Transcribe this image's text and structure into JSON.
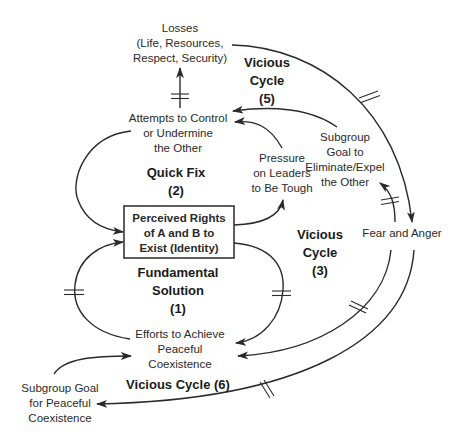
{
  "diagram": {
    "type": "causal-loop",
    "nodes": {
      "losses": {
        "lines": [
          "Losses",
          "(Life, Resources,",
          "Respect, Security)"
        ]
      },
      "attempts": {
        "lines": [
          "Attempts to Control",
          "or Undermine",
          "the Other"
        ]
      },
      "subgroup_eliminate": {
        "lines": [
          "Subgroup",
          "Goal to",
          "Eliminate/Expel",
          "the Other"
        ]
      },
      "pressure": {
        "lines": [
          "Pressure",
          "on Leaders",
          "to Be Tough"
        ]
      },
      "perceived_rights": {
        "lines": [
          "Perceived Rights",
          "of A and B to",
          "Exist (Identity)"
        ]
      },
      "fear_anger": {
        "lines": [
          "Fear and Anger"
        ]
      },
      "efforts": {
        "lines": [
          "Efforts to Achieve",
          "Peaceful",
          "Coexistence"
        ]
      },
      "subgroup_peaceful": {
        "lines": [
          "Subgroup Goal",
          "for Peaceful",
          "Coexistence"
        ]
      }
    },
    "loops": {
      "vicious5": {
        "lines": [
          "Vicious",
          "Cycle",
          "(5)"
        ]
      },
      "quickfix2": {
        "lines": [
          "Quick Fix",
          "(2)"
        ]
      },
      "vicious3": {
        "lines": [
          "Vicious",
          "Cycle",
          "(3)"
        ]
      },
      "fundamental1": {
        "lines": [
          "Fundamental",
          "Solution",
          "(1)"
        ]
      },
      "vicious6": {
        "lines": [
          "Vicious Cycle (6)"
        ]
      }
    },
    "edges": [
      {
        "from": "attempts",
        "to": "losses",
        "delay": true
      },
      {
        "from": "losses",
        "to": "fear_anger",
        "delay": true
      },
      {
        "from": "subgroup_eliminate",
        "to": "attempts",
        "delay": false
      },
      {
        "from": "pressure",
        "to": "attempts",
        "delay": false
      },
      {
        "from": "attempts",
        "to": "perceived_rights",
        "delay": false
      },
      {
        "from": "perceived_rights",
        "to": "pressure",
        "delay": false
      },
      {
        "from": "fear_anger",
        "to": "subgroup_eliminate",
        "delay": true
      },
      {
        "from": "efforts",
        "to": "perceived_rights",
        "delay": true
      },
      {
        "from": "perceived_rights",
        "to": "efforts",
        "delay": true
      },
      {
        "from": "fear_anger",
        "to": "efforts",
        "delay": true
      },
      {
        "from": "fear_anger",
        "to": "subgroup_peaceful",
        "delay": true
      },
      {
        "from": "subgroup_peaceful",
        "to": "efforts",
        "delay": false
      }
    ],
    "colors": {
      "line": "#2a2a2a",
      "background": "#ffffff"
    }
  }
}
